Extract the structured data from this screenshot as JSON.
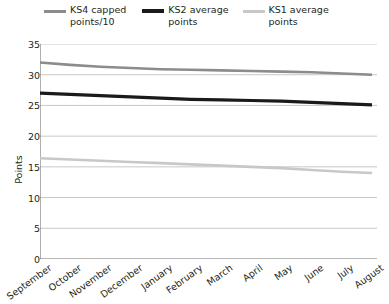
{
  "chart_data": {
    "type": "line",
    "title": "",
    "xlabel": "",
    "ylabel": "Points",
    "ylim": [
      0,
      35
    ],
    "yticks": [
      0,
      5,
      10,
      15,
      20,
      25,
      30,
      35
    ],
    "grid": "horizontal",
    "legend_position": "top",
    "categories": [
      "September",
      "October",
      "November",
      "December",
      "January",
      "February",
      "March",
      "April",
      "May",
      "June",
      "July",
      "August"
    ],
    "series": [
      {
        "name": "KS4 capped points/10",
        "legend_label": "KS4 capped\npoints/10",
        "color": "#8c8c8c",
        "width": 2.6,
        "values": [
          32.0,
          31.6,
          31.3,
          31.1,
          30.9,
          30.8,
          30.7,
          30.6,
          30.5,
          30.4,
          30.2,
          30.0
        ]
      },
      {
        "name": "KS2 average points",
        "legend_label": "KS2 average\npoints",
        "color": "#1a1a1a",
        "width": 3.2,
        "values": [
          27.0,
          26.8,
          26.6,
          26.4,
          26.2,
          26.0,
          25.9,
          25.8,
          25.7,
          25.5,
          25.3,
          25.1
        ]
      },
      {
        "name": "KS1 average points",
        "legend_label": "KS1 average\npoints",
        "color": "#c8c8c8",
        "width": 2.6,
        "values": [
          16.4,
          16.2,
          16.0,
          15.8,
          15.6,
          15.4,
          15.2,
          15.0,
          14.8,
          14.5,
          14.2,
          14.0
        ]
      }
    ]
  },
  "axis": {
    "y_label": "Points",
    "y_tick_labels": [
      "0",
      "5",
      "10",
      "15",
      "20",
      "25",
      "30",
      "35"
    ],
    "x_tick_labels": [
      "September",
      "October",
      "November",
      "December",
      "January",
      "February",
      "March",
      "April",
      "May",
      "June",
      "July",
      "August"
    ]
  },
  "legend": {
    "items": [
      {
        "label": "KS4 capped\npoints/10",
        "color": "#8c8c8c"
      },
      {
        "label": "KS2 average\npoints",
        "color": "#1a1a1a"
      },
      {
        "label": "KS1 average\npoints",
        "color": "#c8c8c8"
      }
    ]
  },
  "colors": {
    "ks4": "#8c8c8c",
    "ks2": "#1a1a1a",
    "ks1": "#c8c8c8",
    "axis": "#6f6f6f",
    "grid": "#b9b9b9",
    "text": "#231f20"
  }
}
